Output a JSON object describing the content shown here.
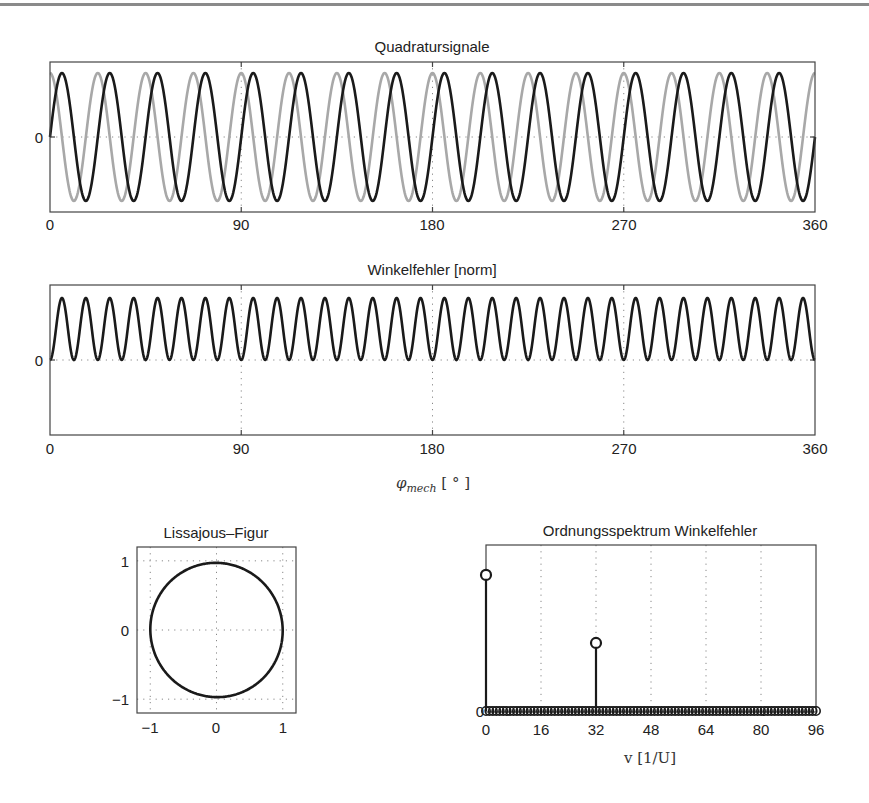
{
  "figure": {
    "top_rule": true,
    "colors": {
      "signal_dark": "#1a1a1a",
      "signal_light": "#a8a8a8",
      "axes": "#444444",
      "grid": "#888888"
    }
  },
  "chart_data": [
    {
      "id": "quadratursignale",
      "type": "line",
      "title": "Quadratursignale",
      "xlabel": "",
      "ylabel": "",
      "xlim": [
        0,
        360
      ],
      "ylim": [
        -1.2,
        1.2
      ],
      "xticks": [
        "0",
        "90",
        "180",
        "270",
        "360"
      ],
      "yticks": [
        "0"
      ],
      "grid": "dotted at ticks",
      "series": [
        {
          "name": "sin (dark)",
          "color": "#1a1a1a",
          "function": "sin(16*phi)",
          "periods": 16,
          "amplitude": 1
        },
        {
          "name": "cos (light)",
          "color": "#a8a8a8",
          "function": "cos(16*phi)",
          "periods": 16,
          "amplitude": 1
        }
      ]
    },
    {
      "id": "winkelfehler",
      "type": "line",
      "title": "Winkelfehler [norm]",
      "xlabel": "φ_mech [°]",
      "xlim": [
        0,
        360
      ],
      "ylim": [
        -1,
        1
      ],
      "xticks": [
        "0",
        "90",
        "180",
        "270",
        "360"
      ],
      "yticks": [
        "0"
      ],
      "grid": "dotted at ticks",
      "series": [
        {
          "name": "Winkelfehler",
          "color": "#1a1a1a",
          "function": "0.5*(1-cos(32*phi))*0.82",
          "periods": 32,
          "min": 0,
          "max": 0.82
        }
      ]
    },
    {
      "id": "lissajous",
      "type": "line",
      "title": "Lissajous–Figur",
      "xlim": [
        -1.2,
        1.2
      ],
      "ylim": [
        -1.2,
        1.2
      ],
      "xticks": [
        "−1",
        "0",
        "1"
      ],
      "yticks": [
        "1",
        "0",
        "−1"
      ],
      "grid": "dotted at ticks",
      "series": [
        {
          "name": "x=cos, y=sin (slightly tilted ellipse)",
          "color": "#1a1a1a",
          "shape": "closed ellipse, radius≈1, tilt≈-10°"
        }
      ]
    },
    {
      "id": "ordnungsspektrum",
      "type": "stem",
      "title": "Ordnungsspektrum Winkelfehler",
      "xlabel": "v [1/U]",
      "xlim": [
        0,
        96
      ],
      "ylim": [
        0,
        1
      ],
      "xticks": [
        "0",
        "16",
        "32",
        "48",
        "64",
        "80",
        "96"
      ],
      "yticks": [
        "0"
      ],
      "grid": "dotted vertical at ticks",
      "x": [
        0,
        32
      ],
      "values": [
        0.82,
        0.41
      ],
      "note": "all other orders 0..96 have zero amplitude (markers on baseline)"
    }
  ],
  "labels": {
    "quad_title": "Quadratursignale",
    "winkel_title": "Winkelfehler [norm]",
    "liss_title": "Lissajous–Figur",
    "spec_title": "Ordnungsspektrum Winkelfehler",
    "xlabel_phi_sym": "φ",
    "xlabel_phi_sub": "mech",
    "xlabel_phi_unit": "[ ° ]",
    "xlabel_spec": "v [1/U]",
    "xt_0": "0",
    "xt_90": "90",
    "xt_180": "180",
    "xt_270": "270",
    "xt_360": "360",
    "yt_0": "0",
    "liss_xm1": "−1",
    "liss_x0": "0",
    "liss_x1": "1",
    "liss_y1": "1",
    "liss_y0": "0",
    "liss_ym1": "−1",
    "sp_0": "0",
    "sp_16": "16",
    "sp_32": "32",
    "sp_48": "48",
    "sp_64": "64",
    "sp_80": "80",
    "sp_96": "96",
    "sp_y0": "0"
  }
}
